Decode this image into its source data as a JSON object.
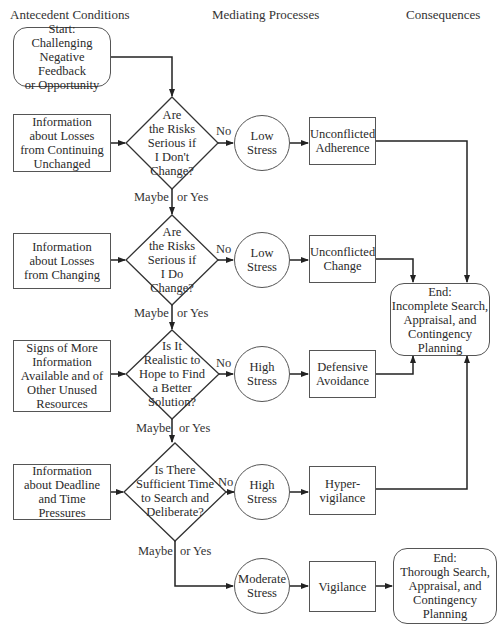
{
  "headers": {
    "antecedent": "Antecedent Conditions",
    "mediating": "Mediating Processes",
    "consequences": "Consequences"
  },
  "start": "Start:\nChallenging\nNegative Feedback\nor Opportunity",
  "antecedents": [
    "Information\nabout Losses\nfrom Continuing\nUnchanged",
    "Information\nabout Losses\nfrom Changing",
    "Signs of More\nInformation\nAvailable and of\nOther Unused\nResources",
    "Information\nabout Deadline\nand Time Pressures"
  ],
  "questions": [
    "Are\nthe Risks\nSerious if\nI Don't\nChange?",
    "Are\nthe Risks\nSerious if\nI Do\nChange?",
    "Is It\nRealistic to\nHope to Find\na Better\nSolution?",
    "Is There\nSufficient Time\nto Search and\nDeliberate?"
  ],
  "branch_labels": {
    "no": "No",
    "maybe": "Maybe",
    "or_yes": "or Yes"
  },
  "stress_levels": [
    "Low\nStress",
    "Low\nStress",
    "High\nStress",
    "High\nStress",
    "Moderate\nStress"
  ],
  "patterns": [
    "Unconflicted\nAdherence",
    "Unconflicted\nChange",
    "Defensive\nAvoidance",
    "Hyper-\nvigilance",
    "Vigilance"
  ],
  "ends": {
    "incomplete": "End:\nIncomplete Search,\nAppraisal, and\nContingency\nPlanning",
    "thorough": "End:\nThorough Search,\nAppraisal, and\nContingency\nPlanning"
  }
}
